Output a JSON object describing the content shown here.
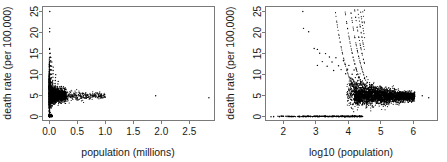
{
  "figure": {
    "background_color": "#ffffff",
    "point_color": "#000000",
    "axis_color": "#7a7a7a",
    "text_color": "#1a1a1a"
  },
  "chart_data": [
    {
      "type": "scatter",
      "panel": "left",
      "title": "",
      "xlabel": "population (millions)",
      "ylabel": "death rate (per 100,000)",
      "xlim": [
        -0.12,
        2.95
      ],
      "ylim": [
        -0.9,
        26.2
      ],
      "xticks": [
        0.0,
        0.5,
        1.0,
        1.5,
        2.0,
        2.5
      ],
      "xticklabels": [
        "0.0",
        "0.5",
        "1.0",
        "1.5",
        "2.0",
        "2.5"
      ],
      "yticks": [
        0,
        5,
        10,
        15,
        20,
        25
      ],
      "yticklabels": [
        "0",
        "5",
        "10",
        "15",
        "20",
        "25"
      ],
      "grid": false,
      "legend": null,
      "description": "Dense vertical spike of counties at near-zero population spanning death rates 0 to 15, tapering tail of larger-population counties converging to about 4-6 per 100,000; two isolated high-population outliers near 1.9 and 2.85 million.",
      "points": [
        [
          0.004,
          0.0
        ],
        [
          0.004,
          1.2
        ],
        [
          0.005,
          2.4
        ],
        [
          0.005,
          3.3
        ],
        [
          0.005,
          4.1
        ],
        [
          0.006,
          5.0
        ],
        [
          0.006,
          6.2
        ],
        [
          0.006,
          7.1
        ],
        [
          0.007,
          8.0
        ],
        [
          0.007,
          9.2
        ],
        [
          0.007,
          10.1
        ],
        [
          0.008,
          11.3
        ],
        [
          0.008,
          12.2
        ],
        [
          0.008,
          13.1
        ],
        [
          0.009,
          14.0
        ],
        [
          0.009,
          15.0
        ],
        [
          0.01,
          0.6
        ],
        [
          0.01,
          2.0
        ],
        [
          0.011,
          3.0
        ],
        [
          0.011,
          4.2
        ],
        [
          0.012,
          5.1
        ],
        [
          0.012,
          6.0
        ],
        [
          0.013,
          7.0
        ],
        [
          0.013,
          8.1
        ],
        [
          0.014,
          9.0
        ],
        [
          0.014,
          10.2
        ],
        [
          0.015,
          11.0
        ],
        [
          0.015,
          12.0
        ],
        [
          0.016,
          13.0
        ],
        [
          0.016,
          14.2
        ],
        [
          0.017,
          15.1
        ],
        [
          0.006,
          16.0
        ],
        [
          0.007,
          16.2
        ],
        [
          0.008,
          20.2
        ],
        [
          0.009,
          21.0
        ],
        [
          0.01,
          25.0
        ],
        [
          0.018,
          1.0
        ],
        [
          0.018,
          2.5
        ],
        [
          0.019,
          3.5
        ],
        [
          0.02,
          4.4
        ],
        [
          0.02,
          5.3
        ],
        [
          0.021,
          6.1
        ],
        [
          0.022,
          7.2
        ],
        [
          0.022,
          8.3
        ],
        [
          0.023,
          9.1
        ],
        [
          0.024,
          10.0
        ],
        [
          0.025,
          11.2
        ],
        [
          0.026,
          12.1
        ],
        [
          0.027,
          13.3
        ],
        [
          0.028,
          14.1
        ],
        [
          0.03,
          2.2
        ],
        [
          0.031,
          3.4
        ],
        [
          0.032,
          4.3
        ],
        [
          0.033,
          5.2
        ],
        [
          0.034,
          6.3
        ],
        [
          0.035,
          7.1
        ],
        [
          0.036,
          8.2
        ],
        [
          0.038,
          9.3
        ],
        [
          0.04,
          10.1
        ],
        [
          0.042,
          11.1
        ],
        [
          0.044,
          12.0
        ],
        [
          0.046,
          13.0
        ],
        [
          0.05,
          3.1
        ],
        [
          0.052,
          4.0
        ],
        [
          0.054,
          4.8
        ],
        [
          0.056,
          5.5
        ],
        [
          0.058,
          6.2
        ],
        [
          0.06,
          7.0
        ],
        [
          0.062,
          7.8
        ],
        [
          0.064,
          8.6
        ],
        [
          0.066,
          9.4
        ],
        [
          0.068,
          10.2
        ],
        [
          0.07,
          11.0
        ],
        [
          0.072,
          11.8
        ],
        [
          0.08,
          3.6
        ],
        [
          0.084,
          4.4
        ],
        [
          0.088,
          5.1
        ],
        [
          0.092,
          5.8
        ],
        [
          0.096,
          6.5
        ],
        [
          0.1,
          7.2
        ],
        [
          0.104,
          7.9
        ],
        [
          0.108,
          8.6
        ],
        [
          0.112,
          9.3
        ],
        [
          0.116,
          10.0
        ],
        [
          0.125,
          3.9
        ],
        [
          0.13,
          4.6
        ],
        [
          0.135,
          5.2
        ],
        [
          0.14,
          5.9
        ],
        [
          0.145,
          6.5
        ],
        [
          0.15,
          7.1
        ],
        [
          0.155,
          7.8
        ],
        [
          0.16,
          8.4
        ],
        [
          0.17,
          4.1
        ],
        [
          0.18,
          4.8
        ],
        [
          0.19,
          5.4
        ],
        [
          0.2,
          6.0
        ],
        [
          0.21,
          6.6
        ],
        [
          0.22,
          7.2
        ],
        [
          0.24,
          4.2
        ],
        [
          0.255,
          4.9
        ],
        [
          0.27,
          5.4
        ],
        [
          0.285,
          5.9
        ],
        [
          0.3,
          6.4
        ],
        [
          0.32,
          4.3
        ],
        [
          0.34,
          4.9
        ],
        [
          0.36,
          5.4
        ],
        [
          0.38,
          5.8
        ],
        [
          0.41,
          4.4
        ],
        [
          0.435,
          4.9
        ],
        [
          0.46,
          5.3
        ],
        [
          0.5,
          4.5
        ],
        [
          0.53,
          5.0
        ],
        [
          0.56,
          5.4
        ],
        [
          0.61,
          4.6
        ],
        [
          0.65,
          5.0
        ],
        [
          0.7,
          4.7
        ],
        [
          0.76,
          5.1
        ],
        [
          0.83,
          4.7
        ],
        [
          0.9,
          4.9
        ],
        [
          1.0,
          4.6
        ],
        [
          1.9,
          5.0
        ],
        [
          2.85,
          4.5
        ]
      ]
    },
    {
      "type": "scatter",
      "panel": "right",
      "title": "",
      "xlabel": "log10 (population)",
      "ylabel": "death rate (per 100,000)",
      "xlim": [
        1.45,
        6.75
      ],
      "ylim": [
        -0.9,
        26.2
      ],
      "xticks": [
        2,
        3,
        4,
        5,
        6
      ],
      "xticklabels": [
        "2",
        "3",
        "4",
        "5",
        "6"
      ],
      "yticks": [
        0,
        5,
        10,
        15,
        20,
        25
      ],
      "yticklabels": [
        "0",
        "5",
        "10",
        "15",
        "20",
        "25"
      ],
      "grid": false,
      "legend": null,
      "description": "Same data on log10 population axis. Discrete hyperbolic arcs correspond to integer death counts (1,2,3,...). A horizontal line of zero-death counties runs along y=0 from log10 population about 1.6 to 4.4; dense cloud converges near death rate 4-6 for large populations.",
      "zero_line_x_range": [
        1.6,
        4.45
      ],
      "arc_death_counts": [
        1,
        2,
        3,
        4,
        5,
        6,
        7,
        8,
        9,
        10,
        12,
        14
      ],
      "points": [
        [
          2.6,
          25.0
        ],
        [
          2.62,
          21.0
        ],
        [
          2.78,
          20.2
        ],
        [
          2.95,
          16.2
        ],
        [
          3.05,
          16.0
        ],
        [
          3.12,
          15.1
        ],
        [
          3.3,
          15.0
        ],
        [
          3.42,
          14.2
        ],
        [
          3.05,
          12.2
        ],
        [
          3.2,
          13.1
        ],
        [
          3.35,
          12.0
        ],
        [
          3.5,
          13.0
        ],
        [
          3.55,
          11.0
        ],
        [
          3.62,
          14.0
        ],
        [
          3.7,
          12.1
        ],
        [
          3.78,
          11.2
        ],
        [
          3.85,
          13.3
        ],
        [
          3.92,
          10.2
        ],
        [
          3.98,
          11.3
        ],
        [
          4.02,
          12.2
        ],
        [
          4.08,
          9.2
        ],
        [
          4.12,
          10.1
        ],
        [
          4.18,
          11.1
        ],
        [
          4.22,
          9.3
        ],
        [
          4.26,
          10.0
        ],
        [
          4.3,
          8.6
        ],
        [
          4.34,
          9.4
        ],
        [
          4.38,
          8.0
        ],
        [
          4.42,
          8.3
        ],
        [
          4.46,
          7.8
        ],
        [
          4.5,
          9.1
        ],
        [
          4.54,
          7.2
        ],
        [
          4.58,
          8.2
        ],
        [
          4.62,
          6.9
        ],
        [
          4.66,
          7.6
        ],
        [
          4.7,
          6.4
        ],
        [
          4.74,
          7.1
        ],
        [
          4.78,
          6.0
        ],
        [
          4.82,
          6.7
        ],
        [
          4.86,
          5.6
        ],
        [
          4.9,
          6.3
        ],
        [
          4.94,
          5.2
        ],
        [
          4.98,
          5.9
        ],
        [
          5.02,
          4.9
        ],
        [
          5.06,
          5.6
        ],
        [
          5.1,
          4.6
        ],
        [
          5.14,
          5.3
        ],
        [
          5.18,
          4.4
        ],
        [
          5.22,
          5.1
        ],
        [
          5.26,
          4.2
        ],
        [
          5.3,
          4.9
        ],
        [
          5.34,
          4.1
        ],
        [
          5.38,
          4.8
        ],
        [
          5.42,
          4.0
        ],
        [
          5.46,
          4.7
        ],
        [
          5.5,
          4.2
        ],
        [
          5.56,
          4.9
        ],
        [
          5.62,
          4.3
        ],
        [
          5.68,
          4.8
        ],
        [
          5.74,
          4.4
        ],
        [
          5.8,
          4.7
        ],
        [
          5.88,
          4.5
        ],
        [
          5.95,
          4.6
        ],
        [
          6.28,
          5.0
        ],
        [
          6.48,
          4.5
        ],
        [
          1.62,
          0.0
        ],
        [
          1.7,
          0.0
        ],
        [
          2.3,
          0.0
        ],
        [
          2.5,
          0.0
        ],
        [
          2.7,
          0.0
        ],
        [
          2.9,
          0.0
        ],
        [
          3.1,
          0.0
        ],
        [
          3.3,
          0.0
        ],
        [
          3.5,
          0.0
        ],
        [
          3.7,
          0.0
        ],
        [
          3.9,
          0.0
        ],
        [
          4.05,
          0.0
        ],
        [
          4.2,
          0.0
        ],
        [
          4.35,
          0.0
        ],
        [
          4.42,
          0.0
        ]
      ]
    }
  ]
}
